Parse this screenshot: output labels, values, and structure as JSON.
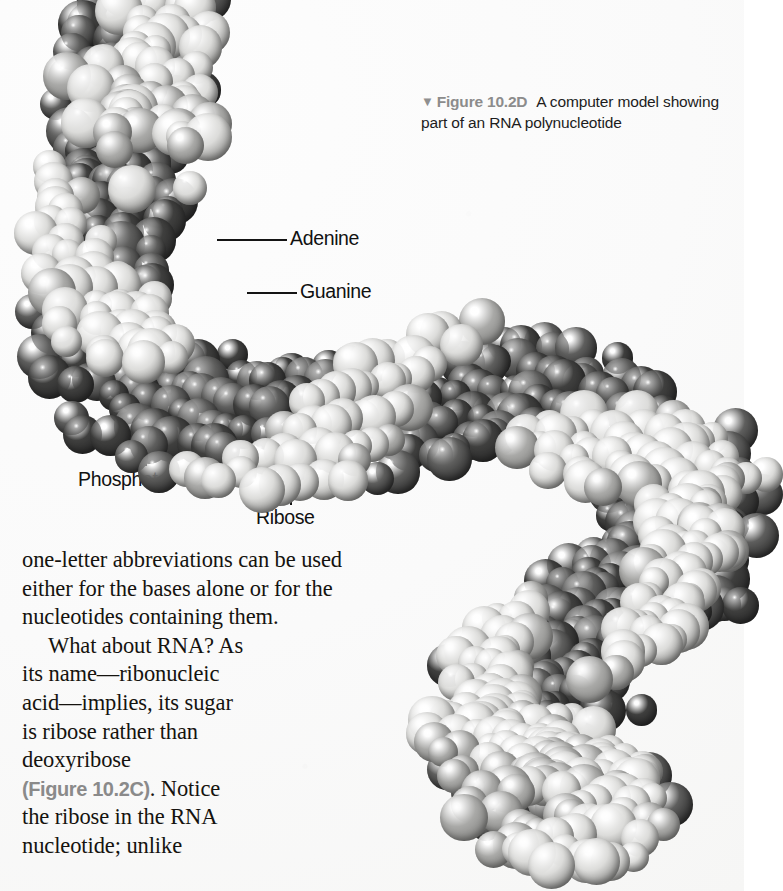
{
  "figure": {
    "marker_icon": "down-triangle-icon",
    "marker_glyph": "▼",
    "number": "Figure 10.2D",
    "caption": "A computer model showing part of an RNA polynucleotide",
    "number_color": "#8c8c8c",
    "caption_color": "#1d1d1d"
  },
  "callouts": [
    {
      "id": "adenine",
      "label": "Adenine"
    },
    {
      "id": "guanine",
      "label": "Guanine"
    },
    {
      "id": "phosphate",
      "label": "Phosphate"
    },
    {
      "id": "ribose",
      "label": "Ribose"
    },
    {
      "id": "uracil",
      "label": "Uracil"
    },
    {
      "id": "cytosine",
      "label": "Cytosine"
    }
  ],
  "body": {
    "line1": "one-letter abbreviations can be used",
    "line2": "either for the bases alone or for the",
    "line3": "nucleotides containing them.",
    "line4": "What about RNA? As",
    "line5": "its name—ribonucleic",
    "line6": "acid—implies, its sugar",
    "line7": "is ribose rather than",
    "line8": "deoxyribose",
    "xref": "(Figure 10.2C)",
    "line9_after_xref": ". Notice",
    "line10": "the ribose in the RNA",
    "line11": "nucleotide; unlike"
  },
  "colors": {
    "page_background": "#fbfbfa",
    "atom_light": "#dcdcda",
    "atom_mid": "#a9a9a7",
    "atom_dark": "#5e5e5d",
    "atom_darkest": "#3f3f3e",
    "leader_line": "#141414",
    "body_text": "#15130f"
  }
}
